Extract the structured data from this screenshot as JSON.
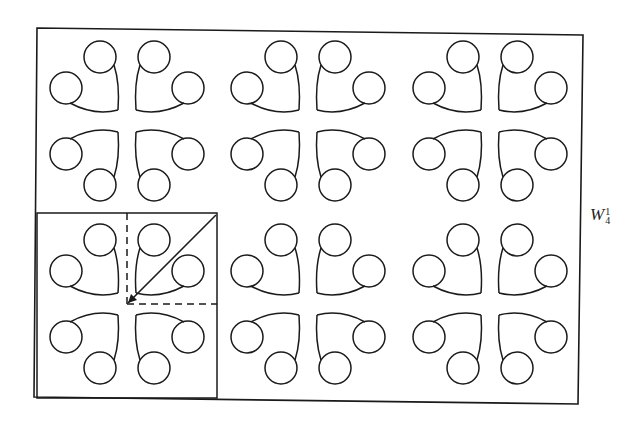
{
  "figure": {
    "label": {
      "base": "W",
      "superscript": "1",
      "subscript": "4"
    },
    "frame": {
      "x1": 37,
      "y1": 28,
      "x2": 580,
      "y2": 402
    },
    "stroke_color": "#1a1a1a",
    "grid": {
      "columns": 3,
      "rows": 2,
      "cell_centers_x": [
        127,
        308,
        490
      ],
      "cell_centers_y": [
        121,
        304
      ]
    },
    "motif": {
      "description": "two circles joined by curved arcs meeting at a corner; 4 mirrored copies per cell",
      "circle_radius": 16,
      "top_circle_offset": [
        -27,
        -64
      ],
      "side_circle_offset": [
        -61,
        -33
      ],
      "corner_offset": [
        -9,
        -11
      ]
    },
    "fundamental_region": {
      "box": {
        "x1": 37,
        "y1": 213,
        "x2": 217,
        "y2": 398
      },
      "dashed_vertical": {
        "x": 127,
        "y1": 213,
        "y2": 304
      },
      "dashed_horizontal": {
        "y": 304,
        "x1": 127,
        "x2": 217
      },
      "diagonal_arrow": {
        "from": [
          216,
          215
        ],
        "to": [
          128,
          303
        ]
      }
    }
  }
}
